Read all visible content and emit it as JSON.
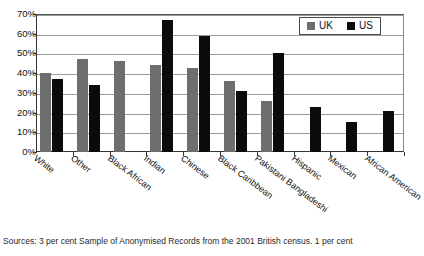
{
  "chart_data": {
    "type": "bar",
    "title": "",
    "xlabel": "",
    "ylabel": "",
    "ylim": [
      0,
      70
    ],
    "ytick_step": 10,
    "grid": true,
    "legend_position": "top-right",
    "categories": [
      "White",
      "Other",
      "Black African",
      "Indian",
      "Chinese",
      "Black Caribbean",
      "Pakistani Bangladeshi",
      "Hispanic",
      "Mexican",
      "African American"
    ],
    "ytick_labels": [
      "70%",
      "60%",
      "50%",
      "40%",
      "30%",
      "20%",
      "10%",
      "0%"
    ],
    "ytick_values": [
      70,
      60,
      50,
      40,
      30,
      20,
      10,
      0
    ],
    "series": [
      {
        "name": "UK",
        "color": "#6e6e6e",
        "values": [
          40,
          47,
          46,
          44,
          42.5,
          36,
          26,
          null,
          null,
          null
        ]
      },
      {
        "name": "US",
        "color": "#0b0b0b",
        "values": [
          37,
          34,
          null,
          67,
          59,
          31,
          50,
          23,
          15,
          21
        ]
      }
    ]
  },
  "legend": {
    "items": [
      {
        "label": "UK",
        "swatch": "uk"
      },
      {
        "label": "US",
        "swatch": "us"
      }
    ]
  },
  "caption": {
    "text": "Sources: 3 per cent Sample of Anonymised Records from the 2001 British census. 1 per cent"
  }
}
